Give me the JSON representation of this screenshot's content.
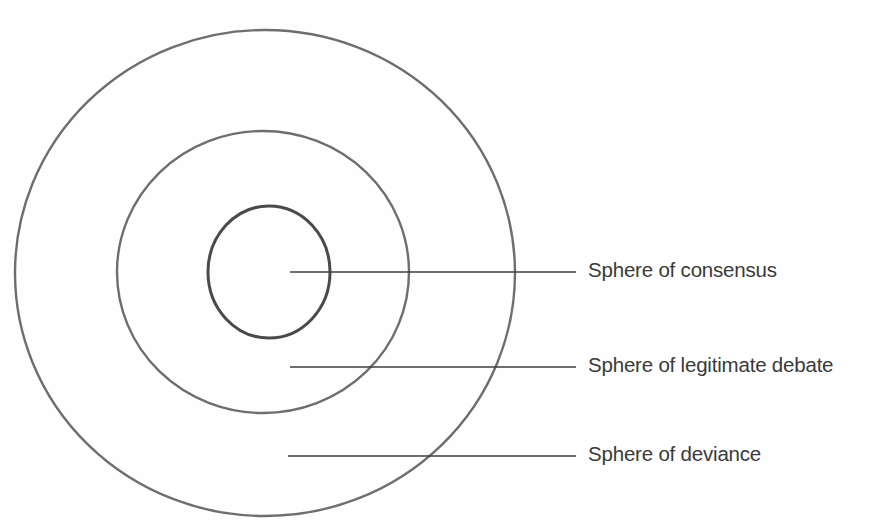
{
  "diagram": {
    "type": "concentric-spheres",
    "title": "",
    "background_color": "#fefefe",
    "stroke_color_outer": "#6e6e6e",
    "stroke_color_middle": "#6e6e6e",
    "stroke_color_inner": "#4a4a4a",
    "leader_line_color": "#3f3f3f",
    "text_color": "#3a3a3a",
    "rings": [
      {
        "id": "outer",
        "label_ref": "deviance",
        "center_x": 265,
        "center_y": 273,
        "radius_x": 250,
        "radius_y": 243,
        "stroke_width": 2.4
      },
      {
        "id": "middle",
        "label_ref": "legitimate_debate",
        "center_x": 263,
        "center_y": 272,
        "radius_x": 146,
        "radius_y": 141,
        "stroke_width": 2.4
      },
      {
        "id": "inner",
        "label_ref": "consensus",
        "center_x": 269,
        "center_y": 272,
        "radius_x": 61,
        "radius_y": 66,
        "stroke_width": 3.0
      }
    ],
    "leader_lines": [
      {
        "id": "consensus",
        "x1": 290,
        "y1": 272,
        "x2": 576,
        "y2": 272
      },
      {
        "id": "legitimate_debate",
        "x1": 290,
        "y1": 367,
        "x2": 576,
        "y2": 367
      },
      {
        "id": "deviance",
        "x1": 288,
        "y1": 456,
        "x2": 576,
        "y2": 456
      }
    ]
  },
  "labels": {
    "consensus": "Sphere of consensus",
    "legitimate_debate": "Sphere of legitimate debate",
    "deviance": "Sphere of deviance"
  }
}
